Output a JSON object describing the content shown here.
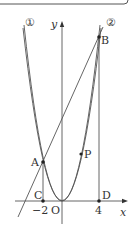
{
  "diagram": {
    "labels": {
      "curve1": "①",
      "curve2": "②",
      "y_axis": "y",
      "x_axis": "x",
      "origin": "O",
      "point_a": "A",
      "point_b": "B",
      "point_c": "C",
      "point_d": "D",
      "point_p": "P",
      "tick_neg2": "−2",
      "tick_4": "4"
    },
    "colors": {
      "line": "#555555",
      "text": "#333333",
      "background": "#ffffff"
    }
  }
}
